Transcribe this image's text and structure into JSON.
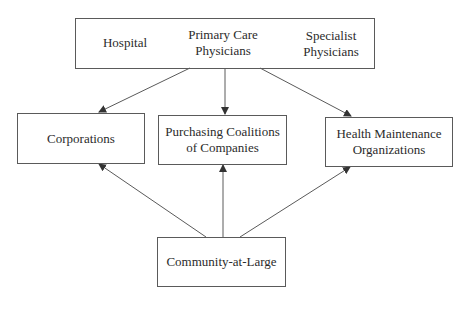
{
  "diagram": {
    "top_box": {
      "items": [
        {
          "label": "Hospital"
        },
        {
          "label": "Primary Care\nPhysicians"
        },
        {
          "label": "Specialist\nPhysicians"
        }
      ]
    },
    "middle_boxes": [
      {
        "label": "Corporations"
      },
      {
        "label": "Purchasing Coalitions\nof Companies"
      },
      {
        "label": "Health Maintenance\nOrganizations"
      }
    ],
    "bottom_box": {
      "label": "Community-at-Large"
    },
    "edges": [
      {
        "from": "Providers (Hospital, Primary Care Physicians, Specialist Physicians)",
        "to": "Corporations"
      },
      {
        "from": "Providers (Hospital, Primary Care Physicians, Specialist Physicians)",
        "to": "Purchasing Coalitions of Companies"
      },
      {
        "from": "Providers (Hospital, Primary Care Physicians, Specialist Physicians)",
        "to": "Health Maintenance Organizations"
      },
      {
        "from": "Community-at-Large",
        "to": "Corporations"
      },
      {
        "from": "Community-at-Large",
        "to": "Purchasing Coalitions of Companies"
      },
      {
        "from": "Community-at-Large",
        "to": "Health Maintenance Organizations"
      }
    ],
    "colors": {
      "line": "#5a5a5a",
      "text": "#2b2b2b",
      "background": "#ffffff"
    }
  }
}
